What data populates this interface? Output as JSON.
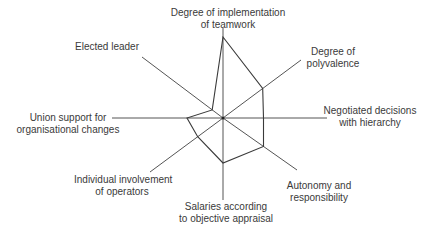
{
  "chart_data": {
    "type": "radar",
    "title": "",
    "axes": [
      "Degree of implementation of teamwork",
      "Degree of polyvalence",
      "Negotiated decisions with hierarchy",
      "Autonomy and responsibility",
      "Salaries according to objective appraisal",
      "Individual involvement of operators",
      "Union support for organisational changes",
      "Elected leader"
    ],
    "series": [
      {
        "name": "profile",
        "values": [
          0.9,
          0.55,
          0.45,
          0.55,
          0.5,
          0.35,
          0.4,
          0.15
        ]
      }
    ],
    "range": [
      0,
      1
    ],
    "grid": false,
    "legend": "none"
  },
  "labels": {
    "teamwork_l1": "Degree of implementation",
    "teamwork_l2": "of teamwork",
    "polyvalence_l1": "Degree of",
    "polyvalence_l2": "polyvalence",
    "negotiated_l1": "Negotiated decisions",
    "negotiated_l2": "with hierarchy",
    "autonomy_l1": "Autonomy and",
    "autonomy_l2": "responsibility",
    "salaries_l1": "Salaries according",
    "salaries_l2": "to objective appraisal",
    "individual_l1": "Individual involvement",
    "individual_l2": "of operators",
    "union_l1": "Union support for",
    "union_l2": "organisational changes",
    "elected_l1": "Elected leader"
  },
  "colors": {
    "line": "#3a3a3a",
    "background": "#ffffff"
  }
}
